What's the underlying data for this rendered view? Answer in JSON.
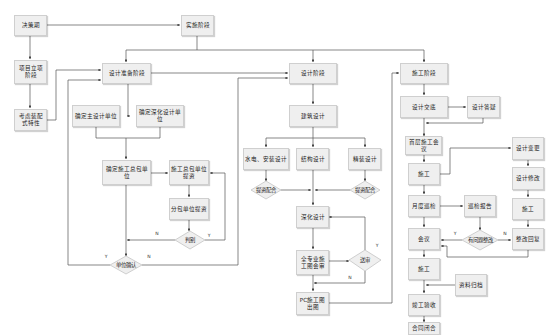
{
  "diagram": {
    "title": "",
    "nodes": {
      "decision_period": "决策期",
      "implementation_phase": "实施阶段",
      "project_approval": "项目立项阶段",
      "consider_prefab": "考虑装配式特性",
      "design_prep": "设计准备阶段",
      "main_designer": "确定主设计单位",
      "detail_designer": "确定深化设计单位",
      "general_contractor": "确定施工总包单位",
      "gc_submit": "施工总包单位提资",
      "sub_submit": "分包单位提资",
      "judge": "判别",
      "unit_confirm": "单位确认",
      "design_phase": "设计阶段",
      "arch_design": "建筑设计",
      "mep_design": "水电、安装设计",
      "struct_design": "结构设计",
      "interior_design": "精装设计",
      "coord_left": "提资配合",
      "coord_right": "提资配合",
      "deepen_design": "深化设计",
      "drawing_review": "全专业施工图会审",
      "submit_review": "送审",
      "pc_drawings": "PC施工图出图",
      "construction_phase": "施工阶段",
      "design_disclosure": "设计交底",
      "design_qa": "设计答疑",
      "first_meeting": "首层施工会议",
      "construct_1": "施工",
      "design_change": "设计变更",
      "design_modify": "设计修改",
      "construct_right": "施工",
      "rectify_reply": "整改回复",
      "monthly_inspection": "月度巡检",
      "inspection_report": "巡检报告",
      "issue_rectify": "有问题整改",
      "meeting": "会议",
      "construct_2": "施工",
      "archive": "资料归档",
      "completion_accept": "竣工验收",
      "contract_close": "合同闭合"
    },
    "branch_labels": {
      "yes": "Y",
      "no": "N"
    }
  }
}
